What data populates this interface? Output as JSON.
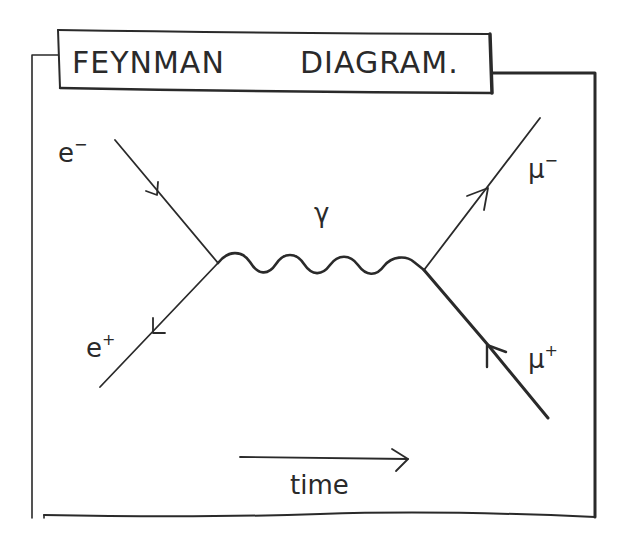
{
  "diagram": {
    "title_part1": "FEYNMAN",
    "title_part2": "DIAGRAM.",
    "particles": {
      "electron": {
        "base": "e",
        "sup": "−"
      },
      "positron": {
        "base": "e",
        "sup": "+"
      },
      "muon": {
        "base": "μ",
        "sup": "−"
      },
      "antimuon": {
        "base": "μ",
        "sup": "+"
      },
      "photon": {
        "base": "γ"
      }
    },
    "time_label": "time"
  },
  "colors": {
    "ink": "#2a2a2a",
    "background": "#ffffff"
  }
}
